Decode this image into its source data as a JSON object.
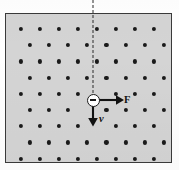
{
  "figure": {
    "field_region": {
      "label": "magnetic-field-region",
      "fill_color": "#d4d4d4",
      "border_color": "#3a3a3a",
      "x": 5,
      "y": 13,
      "width": 167,
      "height": 150
    },
    "field_symbol": {
      "glyph": "dot",
      "meaning": "field-out-of-page",
      "color": "#1a1a1a",
      "radius": 2.1,
      "arrangement": "staggered",
      "rows": 9,
      "dots_per_row": 8,
      "row_spacing": 16.2,
      "column_spacing": 19.1,
      "stagger_offset": 9.5,
      "first_row_x": 20.5,
      "first_row_y": 29
    },
    "charge": {
      "label": "negative-charge",
      "sign": "−",
      "x": 93,
      "y": 100,
      "diameter": 13,
      "fill_color": "#ffffff",
      "border_color": "#1a1a1a"
    },
    "reference_line": {
      "label": "dashed-reference-line",
      "style": "dashed",
      "x": 93,
      "y_start": 0,
      "y_end": 98,
      "color": "#2a2a2a"
    },
    "vectors": [
      {
        "name": "force-vector",
        "label": "F",
        "label_style": "bold",
        "direction": "right",
        "origin_x": 99,
        "origin_y": 100,
        "tip_x": 121,
        "tip_y": 100,
        "color": "#111111"
      },
      {
        "name": "velocity-vector",
        "label": "v",
        "label_style": "bold-italic",
        "direction": "down",
        "origin_x": 93,
        "origin_y": 106,
        "tip_x": 93,
        "tip_y": 124,
        "color": "#111111"
      }
    ]
  }
}
